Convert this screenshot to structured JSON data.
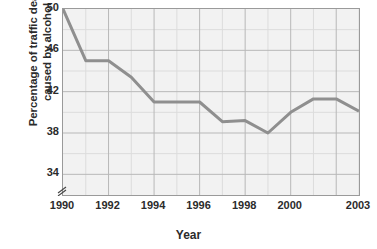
{
  "chart_data": {
    "type": "line",
    "title": "",
    "subtitle": "",
    "xlabel": "Year",
    "ylabel": "Percentage of traffic deaths caused by alcohol",
    "ylabel_lines": [
      "Percentage of traffic deaths",
      "caused by alcohol"
    ],
    "x": [
      1990,
      1991,
      1992,
      1993,
      1994,
      1995,
      1996,
      1997,
      1998,
      1999,
      2000,
      2001,
      2002,
      2003
    ],
    "values": [
      50.0,
      45.0,
      45.0,
      43.4,
      41.0,
      41.0,
      41.0,
      39.1,
      39.2,
      38.0,
      40.0,
      41.3,
      41.3,
      40.1
    ],
    "series": [
      {
        "name": "Percentage of traffic deaths caused by alcohol",
        "values": [
          50.0,
          45.0,
          45.0,
          43.4,
          41.0,
          41.0,
          41.0,
          39.1,
          39.2,
          38.0,
          40.0,
          41.3,
          41.3,
          40.1
        ]
      }
    ],
    "xlim": [
      1990,
      2003
    ],
    "ylim": [
      32.0,
      50.0
    ],
    "ytick_values": [
      50,
      46,
      42,
      38,
      34
    ],
    "ytick_labels": [
      "50",
      "46",
      "42",
      "38",
      "34"
    ],
    "yminor_values": [
      48,
      44,
      40,
      36
    ],
    "xtick_values": [
      1990,
      1992,
      1994,
      1996,
      1998,
      2000,
      2003
    ],
    "xtick_labels": [
      "1990",
      "1992",
      "1994",
      "1996",
      "1998",
      "2000",
      "2003"
    ],
    "xmajor_gridlines": [
      1990,
      1992,
      1994,
      1996,
      1998,
      2000,
      2002
    ],
    "xminor_gridlines": [
      1991,
      1993,
      1995,
      1997,
      1999,
      2001,
      2003
    ],
    "grid": true,
    "legend": false,
    "legend_position": "none",
    "y_axis_break": true,
    "annotations": []
  },
  "style": {
    "line_color": "#8f8f8f",
    "plot_background": "#f2f2f2",
    "major_grid_color": "#b8b8b8",
    "minor_grid_color": "#dcdcdc",
    "axis_color": "#9a9a9a",
    "text_color": "#2b2b2b",
    "page_background": "#ffffff"
  },
  "icons": {
    "axis_break": "axis-break-icon"
  }
}
